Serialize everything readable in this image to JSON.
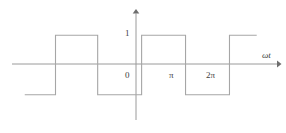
{
  "figure": {
    "background_color": "#ffffff",
    "line_color": "#a6a6a6",
    "axis_color": "#9a9a9a",
    "text_color": "#3d3d3d"
  },
  "labels": {
    "y_value_one": "1",
    "origin": "0",
    "tick_pi": "π",
    "tick_two_pi": "2π",
    "x_axis_name": "ωt"
  },
  "chart_data": {
    "type": "line",
    "title": "",
    "subtitle": "",
    "xlabel": "ωt",
    "ylabel": "",
    "grid": false,
    "legend": false,
    "waveform": "square",
    "amplitude": 1,
    "period_in_rad": 2,
    "duty_cycle": 0.5,
    "xlim": [
      -2.95,
      3.15
    ],
    "ylim": [
      -1.85,
      1.85
    ],
    "xtick_values": [
      0,
      1,
      2
    ],
    "xtick_labels": [
      "0",
      "π",
      "2π"
    ],
    "ytick_values": [
      1
    ],
    "ytick_labels": [
      "1"
    ],
    "x": [
      -2.66,
      -1.96,
      -1.96,
      -1.0,
      -1.0,
      0.0,
      0.0,
      1.0,
      1.0,
      2.0,
      2.0,
      2.62
    ],
    "y": [
      -1,
      -1,
      1,
      1,
      -1,
      -1,
      1,
      1,
      -1,
      -1,
      1,
      1
    ],
    "series": [
      {
        "name": "square wave",
        "x": [
          -2.66,
          -1.96,
          -1.96,
          -1.0,
          -1.0,
          0.0,
          0.0,
          1.0,
          1.0,
          2.0,
          2.0,
          2.62
        ],
        "values": [
          -1,
          -1,
          1,
          1,
          -1,
          -1,
          1,
          1,
          -1,
          -1,
          1,
          1
        ]
      }
    ],
    "annotations": [
      {
        "text": "1",
        "x": -0.2,
        "y": 1.0
      },
      {
        "text": "0",
        "x": -0.2,
        "y": -0.28
      },
      {
        "text": "π",
        "x": 0.78,
        "y": -0.28
      },
      {
        "text": "2π",
        "x": 1.62,
        "y": -0.28
      },
      {
        "text": "ωt",
        "x": 2.82,
        "y": 0.42
      }
    ]
  },
  "geometry": {
    "width": 286,
    "height": 133,
    "x_axis_y": 64,
    "y_axis_x": 136,
    "high_y": 32,
    "low_y": 96,
    "x_axis_start": 12,
    "x_axis_end": 280,
    "y_axis_top": 10,
    "y_axis_bottom": 120,
    "edges_x": [
      14,
      40,
      88,
      136,
      182,
      229,
      257
    ]
  }
}
